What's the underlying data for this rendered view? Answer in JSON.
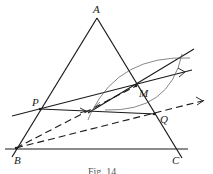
{
  "figure": {
    "caption": "Fig. 14",
    "points": {
      "A": {
        "label": "A",
        "x": 97,
        "y": 18
      },
      "B": {
        "label": "B",
        "x": 16,
        "y": 148
      },
      "C": {
        "label": "C",
        "x": 176,
        "y": 150
      },
      "P": {
        "label": "P",
        "x": 40,
        "y": 109
      },
      "M": {
        "label": "M",
        "x": 136,
        "y": 86
      },
      "Q": {
        "label": "Q",
        "x": 154,
        "y": 114
      }
    },
    "colors": {
      "line": "#1a1a1a",
      "arc": "#555555",
      "text": "#222222"
    }
  }
}
